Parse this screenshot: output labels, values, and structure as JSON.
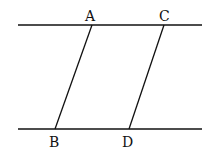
{
  "diagram": {
    "type": "geometry",
    "lines": [
      {
        "name": "top-parallel-line",
        "x1": 18,
        "y1": 25,
        "x2": 202,
        "y2": 25
      },
      {
        "name": "bottom-parallel-line",
        "x1": 18,
        "y1": 129,
        "x2": 202,
        "y2": 129
      },
      {
        "name": "segment-AB",
        "x1": 92,
        "y1": 25,
        "x2": 55,
        "y2": 129
      },
      {
        "name": "segment-CD",
        "x1": 164,
        "y1": 25,
        "x2": 129,
        "y2": 129
      }
    ],
    "points": [
      {
        "label": "A",
        "x": 86,
        "y": 20
      },
      {
        "label": "C",
        "x": 160,
        "y": 20
      },
      {
        "label": "B",
        "x": 49,
        "y": 146
      },
      {
        "label": "D",
        "x": 122,
        "y": 146
      }
    ]
  }
}
